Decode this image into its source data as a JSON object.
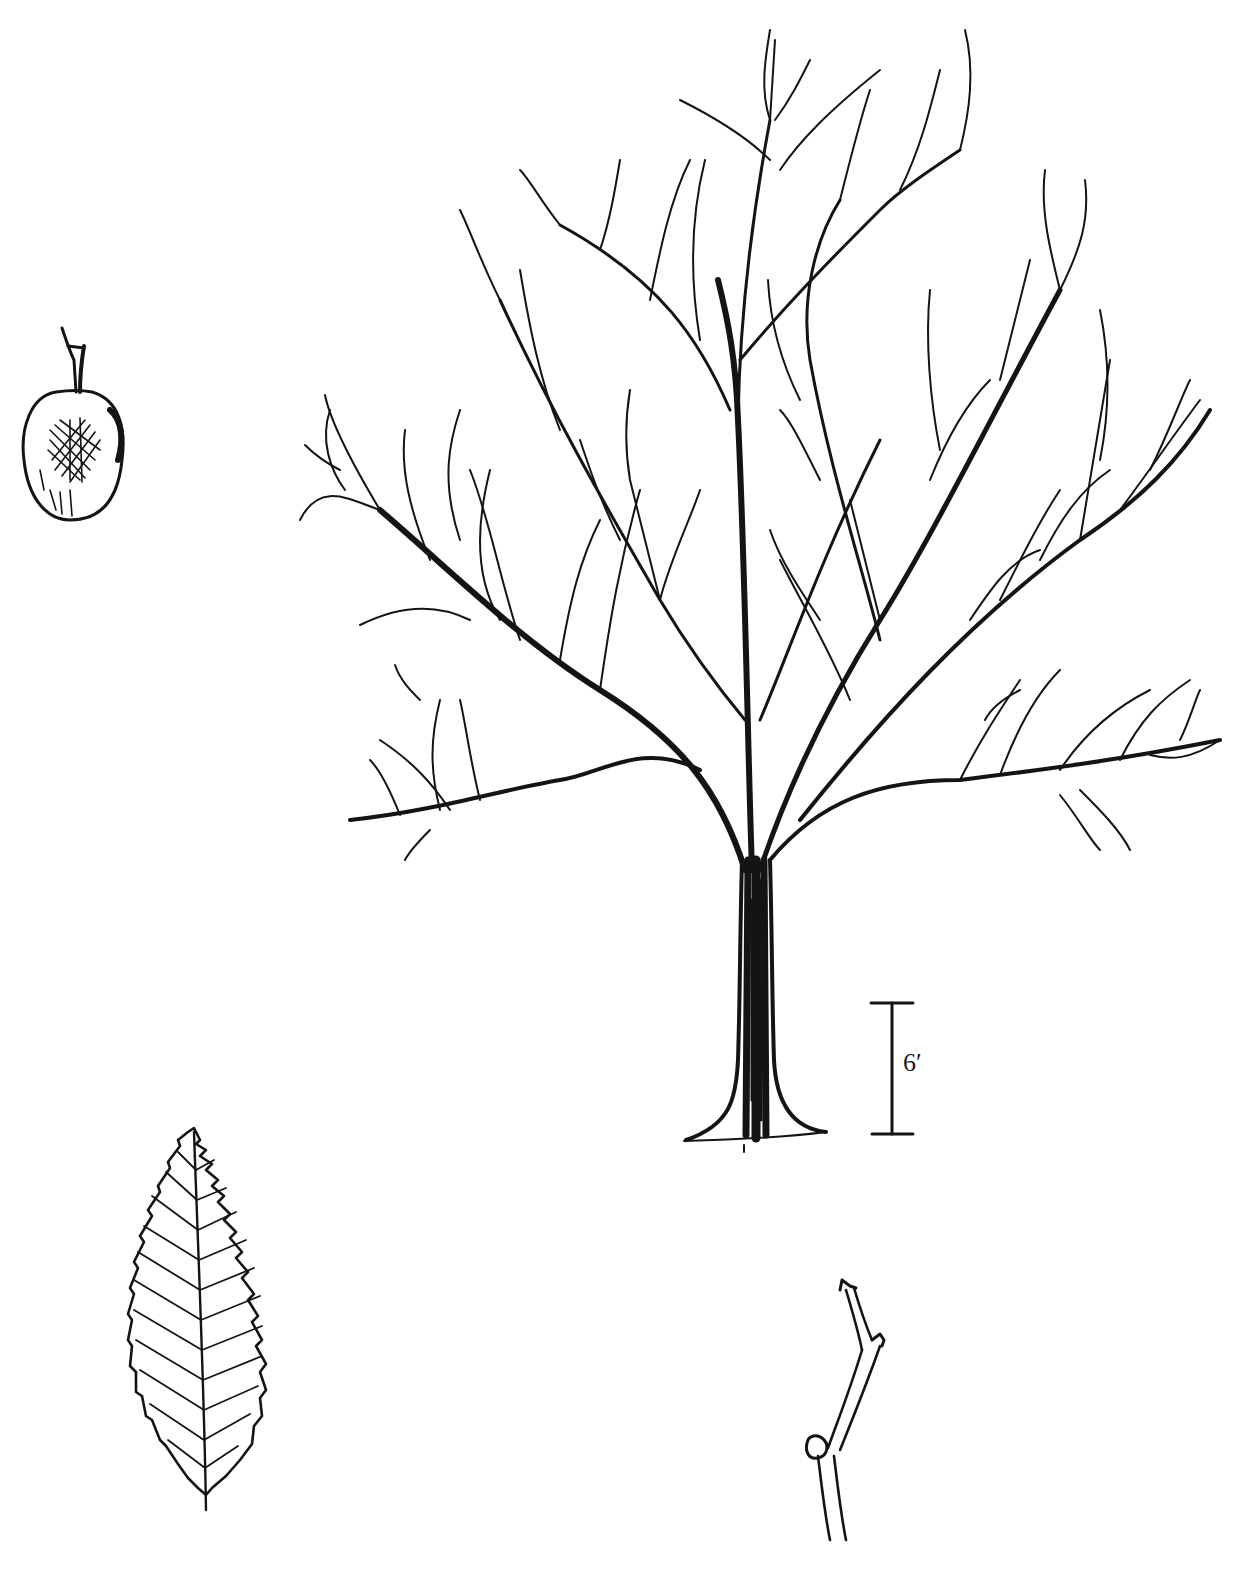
{
  "plate": {
    "subject": "botanical illustration of a deciduous tree in winter form",
    "ink_color": "#141414",
    "background_color": "#ffffff"
  },
  "figures": [
    {
      "id": "tree",
      "description": "bare tree silhouette with spreading crown"
    },
    {
      "id": "fruit",
      "description": "winged seed / fruit with stalk"
    },
    {
      "id": "leaf",
      "description": "ovate serrate leaf with pinnate venation"
    },
    {
      "id": "twig",
      "description": "zig-zag twig with buds"
    }
  ],
  "scale_bar": {
    "label": "6′"
  }
}
